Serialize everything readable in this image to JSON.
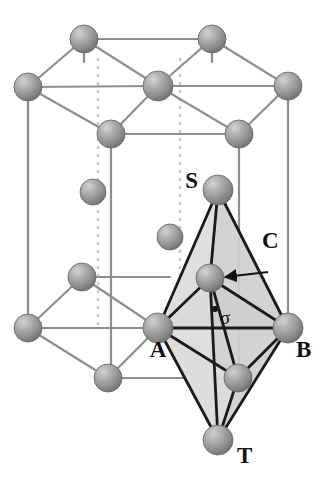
{
  "figure": {
    "kind": "crystal-structure-diagram",
    "background_color": "#ffffff"
  },
  "colors": {
    "sphere_highlight": "#c9c9c9",
    "sphere_mid": "#9c9c9c",
    "sphere_shadow": "#6f6f6f",
    "sphere_outline": "#6b6b6b",
    "lattice_line": "#8e8e8e",
    "lattice_dashed": "#c8c8c8",
    "polyhedron_edge": "#1a1a1a",
    "face_light": "#dcdcdc",
    "face_mid": "#cfcfcf",
    "face_dark": "#c2c2c2",
    "label_text": "#111111"
  },
  "labels": [
    {
      "id": "S",
      "text": "S",
      "x": 198,
      "y": 188,
      "anchor": "end",
      "desc": "top apex atom of octahedron"
    },
    {
      "id": "C",
      "text": "C",
      "x": 262,
      "y": 248,
      "anchor": "start",
      "desc": "central interstitial atom, arrow target"
    },
    {
      "id": "A",
      "text": "A",
      "x": 158,
      "y": 357,
      "anchor": "middle",
      "desc": "left equatorial atom"
    },
    {
      "id": "B",
      "text": "B",
      "x": 296,
      "y": 357,
      "anchor": "start",
      "desc": "right equatorial atom"
    },
    {
      "id": "T",
      "text": "T",
      "x": 237,
      "y": 463,
      "anchor": "start",
      "desc": "bottom apex atom of octahedron"
    },
    {
      "id": "sigma",
      "text": "σ",
      "x": 220,
      "y": 324,
      "anchor": "start",
      "desc": "sigma plane marker"
    }
  ],
  "atoms": [
    {
      "id": "top-back-left",
      "cx": 84,
      "cy": 39,
      "r": 14,
      "layer": "top",
      "role": "corner"
    },
    {
      "id": "top-back-right",
      "cx": 212,
      "cy": 39,
      "r": 14,
      "layer": "top",
      "role": "corner"
    },
    {
      "id": "top-left",
      "cx": 28,
      "cy": 87,
      "r": 14,
      "layer": "top",
      "role": "corner"
    },
    {
      "id": "top-center",
      "cx": 158,
      "cy": 86,
      "r": 15,
      "layer": "top",
      "role": "face-center"
    },
    {
      "id": "top-right",
      "cx": 288,
      "cy": 86,
      "r": 14,
      "layer": "top",
      "role": "corner"
    },
    {
      "id": "top-front-left",
      "cx": 111,
      "cy": 134,
      "r": 14,
      "layer": "top",
      "role": "corner"
    },
    {
      "id": "top-front-right",
      "cx": 239,
      "cy": 134,
      "r": 14,
      "layer": "top",
      "role": "corner"
    },
    {
      "id": "mid-left",
      "cx": 93,
      "cy": 192,
      "r": 13,
      "layer": "middle",
      "role": "interior"
    },
    {
      "id": "mid-inner",
      "cx": 170,
      "cy": 237,
      "r": 13,
      "layer": "middle",
      "role": "interior"
    },
    {
      "id": "apex-S",
      "cx": 218,
      "cy": 190,
      "r": 15,
      "layer": "middle",
      "role": "octahedron-apex-top"
    },
    {
      "id": "center-C",
      "cx": 210,
      "cy": 278,
      "r": 14,
      "layer": "middle",
      "role": "octahedron-center"
    },
    {
      "id": "bot-back-left",
      "cx": 82,
      "cy": 277,
      "r": 14,
      "layer": "bottom",
      "role": "corner"
    },
    {
      "id": "bot-left",
      "cx": 28,
      "cy": 328,
      "r": 14,
      "layer": "bottom",
      "role": "corner"
    },
    {
      "id": "eq-A",
      "cx": 158,
      "cy": 328,
      "r": 15,
      "layer": "bottom",
      "role": "octahedron-equator"
    },
    {
      "id": "eq-B",
      "cx": 288,
      "cy": 328,
      "r": 15,
      "layer": "bottom",
      "role": "octahedron-equator"
    },
    {
      "id": "bot-front-left",
      "cx": 108,
      "cy": 378,
      "r": 14,
      "layer": "bottom",
      "role": "corner"
    },
    {
      "id": "eq-front",
      "cx": 238,
      "cy": 378,
      "r": 14,
      "layer": "bottom",
      "role": "octahedron-equator-front"
    },
    {
      "id": "apex-T",
      "cx": 218,
      "cy": 440,
      "r": 15,
      "layer": "bottom",
      "role": "octahedron-apex-bottom"
    }
  ],
  "lattice_edges": [
    [
      84,
      39,
      212,
      39
    ],
    [
      84,
      39,
      28,
      87
    ],
    [
      84,
      39,
      158,
      86
    ],
    [
      212,
      39,
      158,
      86
    ],
    [
      212,
      39,
      288,
      86
    ],
    [
      28,
      87,
      158,
      86
    ],
    [
      158,
      86,
      288,
      86
    ],
    [
      28,
      87,
      111,
      134
    ],
    [
      158,
      86,
      111,
      134
    ],
    [
      158,
      86,
      239,
      134
    ],
    [
      288,
      86,
      239,
      134
    ],
    [
      111,
      134,
      239,
      134
    ],
    [
      84,
      39,
      84,
      62
    ],
    [
      212,
      39,
      212,
      62
    ],
    [
      28,
      87,
      28,
      328
    ],
    [
      288,
      86,
      288,
      328
    ],
    [
      111,
      134,
      111,
      378
    ],
    [
      239,
      134,
      239,
      378
    ],
    [
      82,
      277,
      28,
      328
    ],
    [
      82,
      277,
      158,
      328
    ],
    [
      158,
      328,
      28,
      328
    ],
    [
      28,
      328,
      108,
      378
    ],
    [
      158,
      328,
      108,
      378
    ],
    [
      158,
      328,
      238,
      378
    ],
    [
      288,
      328,
      238,
      378
    ],
    [
      108,
      378,
      238,
      378
    ],
    [
      158,
      328,
      288,
      328
    ],
    [
      82,
      277,
      170,
      277
    ]
  ],
  "lattice_dashed_edges": [
    [
      98,
      58,
      98,
      328
    ],
    [
      180,
      58,
      180,
      328
    ]
  ],
  "octahedron_faces": [
    {
      "id": "face-S-A-C",
      "points": "218,190 158,328 210,278",
      "shade": "face_light"
    },
    {
      "id": "face-S-C-B",
      "points": "218,190 210,278 288,328",
      "shade": "face_mid"
    },
    {
      "id": "face-A-C-B",
      "points": "158,328 210,278 288,328",
      "shade": "face_dark"
    },
    {
      "id": "face-A-T-C",
      "points": "158,328 218,440 210,278",
      "shade": "face_light"
    },
    {
      "id": "face-C-T-B",
      "points": "210,278 218,440 288,328",
      "shade": "face_mid"
    },
    {
      "id": "face-A-T-front",
      "points": "158,328 218,440 238,378",
      "shade": "face_light"
    }
  ],
  "octahedron_edges": [
    [
      218,
      190,
      158,
      328
    ],
    [
      218,
      190,
      288,
      328
    ],
    [
      218,
      190,
      210,
      278
    ],
    [
      158,
      328,
      288,
      328
    ],
    [
      158,
      328,
      210,
      278
    ],
    [
      288,
      328,
      210,
      278
    ],
    [
      158,
      328,
      218,
      440
    ],
    [
      288,
      328,
      218,
      440
    ],
    [
      210,
      278,
      218,
      440
    ],
    [
      158,
      328,
      238,
      378
    ],
    [
      288,
      328,
      238,
      378
    ],
    [
      210,
      278,
      238,
      378
    ],
    [
      238,
      378,
      218,
      440
    ]
  ],
  "annotation_arrow": {
    "id": "C-arrow",
    "from_x": 268,
    "from_y": 272,
    "to_x": 225,
    "to_y": 277,
    "label_ref": "C",
    "desc": "arrow from label C to the central atom"
  },
  "sigma_dot": {
    "cx": 215,
    "cy": 309,
    "r": 3
  }
}
